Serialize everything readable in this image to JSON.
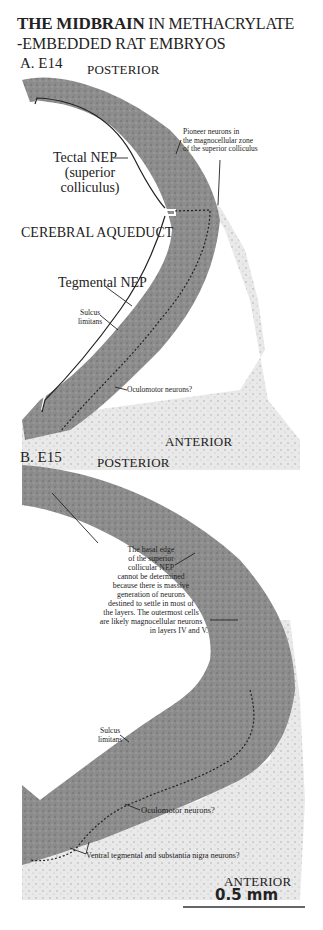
{
  "figure": {
    "title_bold": "THE MIDBRAIN",
    "title_rest": " IN METHACRYLATE",
    "subtitle": "-EMBEDDED RAT EMBRYOS",
    "tissue_color": "#8a8a8a",
    "tissue_light_color": "#c9c9c9",
    "line_color": "#222222"
  },
  "panel_a": {
    "label": "A. E14",
    "posterior": "POSTERIOR",
    "anterior": "ANTERIOR",
    "pioneer_note": [
      "Pioneer neurons in",
      "the magnocellular zone",
      "of the superior colliculus"
    ],
    "tectal_nep": [
      "Tectal NEP",
      "(superior",
      "colliculus)"
    ],
    "cerebral_aqueduct": "CEREBRAL AQUEDUCT",
    "tegmental_nep": "Tegmental NEP",
    "sulcus_limitans": [
      "Sulcus",
      "limitans"
    ],
    "oculomotor": "Oculomotor neurons?"
  },
  "panel_b": {
    "label": "B. E15",
    "posterior": "POSTERIOR",
    "anterior": "ANTERIOR",
    "basal_edge_note": [
      "The basal edge",
      "of the superior",
      "collicular NEP",
      "cannot be determined",
      "because there is massive",
      "generation of neurons",
      "destined to settle in most of",
      "the layers.  The outermost cells",
      "are likely magnocellular neurons",
      "in layers IV and V."
    ],
    "sulcus_limitans": [
      "Sulcus",
      "limitans"
    ],
    "oculomotor": "Oculomotor neurons?",
    "ventral_tegmental": "Ventral tegmental and substantia nigra neurons?"
  },
  "scale_bar": {
    "label": "0.5 mm"
  }
}
